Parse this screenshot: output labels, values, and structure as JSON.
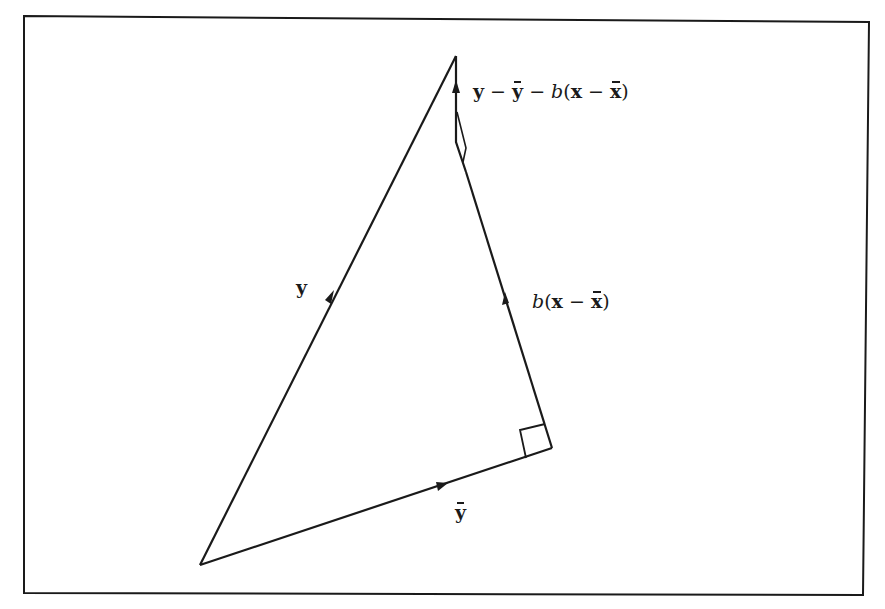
{
  "figure": {
    "colors": {
      "stroke": "#1a1a1a",
      "background": "#ffffff"
    },
    "points": {
      "origin": [
        200,
        565
      ],
      "apex": [
        456,
        56
      ],
      "foot": [
        552,
        448
      ],
      "residual_base": [
        466,
        172
      ]
    },
    "vectors": [
      {
        "name": "y",
        "label": "y",
        "from": "origin",
        "to": "apex"
      },
      {
        "name": "y-bar",
        "label": "ȳ",
        "from": "origin",
        "to": "foot"
      },
      {
        "name": "b-x-minus-xbar",
        "label": "b(x − x̄)",
        "from": "foot",
        "to": "residual_base"
      },
      {
        "name": "residual",
        "label": "y − ȳ − b(x − x̄)",
        "from": "residual_base",
        "to": "apex"
      }
    ],
    "right_angle_markers": 2
  },
  "labels": {
    "y": {
      "main": "y"
    },
    "ybar": {
      "main": "y"
    },
    "bx": {
      "b": "b",
      "open": "(",
      "x": "x",
      "minus": " − ",
      "xbar": "x",
      "close": ")"
    },
    "residual": {
      "y": "y",
      "m1": " − ",
      "ybar": "y",
      "m2": " − ",
      "b": "b",
      "open": "(",
      "x": "x",
      "m3": " − ",
      "xbar": "x",
      "close": ")"
    }
  }
}
